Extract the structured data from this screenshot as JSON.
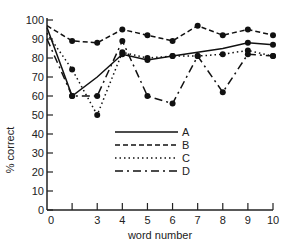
{
  "chart_data": {
    "type": "line",
    "title": "",
    "xlabel": "word number",
    "ylabel": "% correct",
    "xlim": [
      1,
      10
    ],
    "ylim": [
      0,
      100
    ],
    "x_tick_positions": [
      1,
      2,
      3,
      4,
      5,
      6,
      7,
      8,
      9,
      10
    ],
    "x_tick_labels": [
      "0",
      "",
      "3",
      "4",
      "5",
      "6",
      "7",
      "8",
      "9",
      "10"
    ],
    "y_ticks": [
      0,
      10,
      20,
      30,
      40,
      50,
      60,
      70,
      80,
      90,
      100
    ],
    "grid": false,
    "legend_position": "inside-lower-center",
    "x": [
      1,
      2,
      3,
      4,
      5,
      6,
      7,
      8,
      9,
      10
    ],
    "series": [
      {
        "name": "A",
        "style": "solid",
        "markers": [
          false,
          true,
          false,
          true,
          true,
          true,
          false,
          false,
          true,
          true
        ],
        "values": [
          96,
          60,
          70,
          82,
          79,
          81,
          83,
          85,
          88,
          87
        ]
      },
      {
        "name": "B",
        "style": "dashed",
        "markers": [
          false,
          true,
          true,
          true,
          true,
          true,
          true,
          true,
          true,
          true
        ],
        "values": [
          97,
          89,
          88,
          95,
          92,
          89,
          97,
          92,
          95,
          92
        ]
      },
      {
        "name": "C",
        "style": "dotted",
        "markers": [
          false,
          true,
          true,
          true,
          true,
          true,
          true,
          true,
          true,
          true
        ],
        "values": [
          93,
          74,
          50,
          83,
          80,
          81,
          81,
          82,
          84,
          81
        ]
      },
      {
        "name": "D",
        "style": "dash-dot",
        "markers": [
          false,
          true,
          true,
          true,
          true,
          true,
          true,
          true,
          true,
          true
        ],
        "values": [
          90,
          60,
          60,
          89,
          60,
          56,
          81,
          62,
          82,
          81
        ]
      }
    ]
  },
  "legend": {
    "items": [
      "A",
      "B",
      "C",
      "D"
    ]
  },
  "axes": {
    "xlabel": "word number",
    "ylabel": "% correct"
  }
}
